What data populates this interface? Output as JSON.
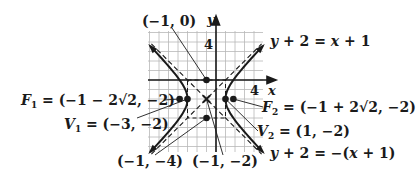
{
  "figure": {
    "equation": "(x+1)^2/4 - (y+2)^2/4 = 1",
    "axis_labels": {
      "x": "x",
      "y": "y"
    },
    "tick_labels": {
      "x_tick": "4",
      "y_tick": "4"
    },
    "center": {
      "label": "(−1, −2)",
      "x": -1,
      "y": -2
    },
    "points": [
      {
        "id": "top_box",
        "label": "(−1, 0)",
        "x": -1,
        "y": 0
      },
      {
        "id": "bottom_box",
        "label": "(−1, −4)",
        "x": -1,
        "y": -4
      },
      {
        "id": "F1",
        "name": "F",
        "sub": "1",
        "label": "= (−1 − 2√2, −2)",
        "x": -3.828,
        "y": -2
      },
      {
        "id": "F2",
        "name": "F",
        "sub": "2",
        "label": "= (−1 + 2√2, −2)",
        "x": 1.828,
        "y": -2
      },
      {
        "id": "V1",
        "name": "V",
        "sub": "1",
        "label": "= (−3, −2)",
        "x": -3,
        "y": -2
      },
      {
        "id": "V2",
        "name": "V",
        "sub": "2",
        "label": "= (1, −2)",
        "x": 1,
        "y": -2
      }
    ],
    "asymptotes": [
      {
        "label": "y + 2 = x + 1"
      },
      {
        "label": "y + 2 = −(x + 1)"
      }
    ],
    "colors": {
      "ink": "#1a1a1a",
      "grid": "#b8b8b8",
      "background": "#ffffff"
    }
  }
}
